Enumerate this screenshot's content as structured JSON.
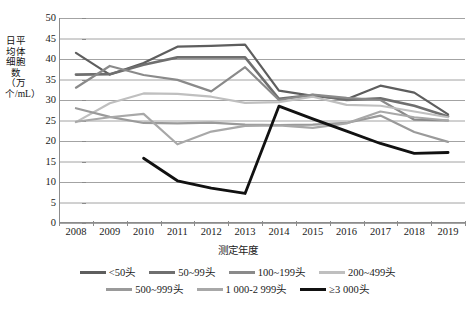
{
  "chart_data": {
    "type": "line",
    "title": "",
    "xlabel": "测定年度",
    "ylabel": "日平均体细胞数（万个/mL）",
    "ylim": [
      0,
      50
    ],
    "ytick_step": 5,
    "yticks": [
      0,
      5,
      10,
      15,
      20,
      25,
      30,
      35,
      40,
      45,
      50
    ],
    "grid": true,
    "legend_position": "bottom",
    "categories": [
      "2008",
      "2009",
      "2010",
      "2011",
      "2012",
      "2013",
      "2014",
      "2015",
      "2016",
      "2017",
      "2018",
      "2019"
    ],
    "series": [
      {
        "name": "<50头",
        "color": "#5e5e5e",
        "width": 2.2,
        "values": [
          41.5,
          36.2,
          39.0,
          43.0,
          43.2,
          43.5,
          32.3,
          31.0,
          30.2,
          33.5,
          31.8,
          26.5
        ]
      },
      {
        "name": "50~99头",
        "color": "#6f6f6f",
        "width": 2.6,
        "values": [
          36.2,
          36.3,
          38.6,
          40.4,
          40.4,
          40.4,
          30.3,
          31.2,
          30.0,
          30.4,
          28.6,
          26.0
        ]
      },
      {
        "name": "100~199头",
        "color": "#8a8a8a",
        "width": 2.2,
        "values": [
          33.0,
          38.3,
          36.1,
          34.9,
          32.1,
          38.0,
          30.0,
          31.3,
          30.5,
          30.0,
          25.2,
          25.0
        ]
      },
      {
        "name": "200~499头",
        "color": "#bfbfbf",
        "width": 2.2,
        "values": [
          24.6,
          29.2,
          31.6,
          31.5,
          30.8,
          29.3,
          29.5,
          30.8,
          28.8,
          28.6,
          27.2,
          25.8
        ]
      },
      {
        "name": "500~999头",
        "color": "#9a9a9a",
        "width": 2.2,
        "values": [
          28.0,
          25.9,
          24.4,
          24.3,
          24.5,
          24.0,
          23.9,
          24.0,
          24.4,
          26.2,
          22.2,
          19.8
        ]
      },
      {
        "name": "1 000-2 999头",
        "color": "#a8a8a8",
        "width": 2.2,
        "values": [
          24.7,
          25.8,
          26.6,
          19.2,
          22.3,
          23.7,
          23.8,
          23.2,
          24.3,
          27.2,
          25.8,
          25.0
        ]
      },
      {
        "name": "≥3 000头",
        "color": "#111111",
        "width": 2.8,
        "values": [
          null,
          null,
          15.8,
          10.3,
          8.5,
          7.2,
          28.5,
          25.4,
          22.4,
          19.4,
          17.0,
          17.2
        ]
      }
    ]
  }
}
